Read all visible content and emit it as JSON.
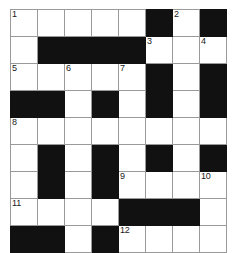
{
  "puzzle": {
    "type": "crossword-grid",
    "title": "",
    "columns": 8,
    "rows": 9,
    "cell_size_px": 26,
    "colors": {
      "block": "#111111",
      "empty": "#ffffff",
      "gridline": "#9a9a9a",
      "number_text": "#1a1a1a",
      "page_background": "#ffffff"
    },
    "clue_numbers": [
      1,
      2,
      3,
      4,
      5,
      6,
      7,
      8,
      9,
      10,
      11,
      12
    ],
    "legend": {
      "block_char": "#",
      "open_char": "."
    },
    "grid": [
      [
        {
          "state": "open",
          "number": "1"
        },
        {
          "state": "open",
          "number": ""
        },
        {
          "state": "open",
          "number": ""
        },
        {
          "state": "open",
          "number": ""
        },
        {
          "state": "open",
          "number": ""
        },
        {
          "state": "block",
          "number": ""
        },
        {
          "state": "open",
          "number": "2"
        },
        {
          "state": "block",
          "number": ""
        }
      ],
      [
        {
          "state": "open",
          "number": ""
        },
        {
          "state": "block",
          "number": ""
        },
        {
          "state": "block",
          "number": ""
        },
        {
          "state": "block",
          "number": ""
        },
        {
          "state": "block",
          "number": ""
        },
        {
          "state": "open",
          "number": "3"
        },
        {
          "state": "open",
          "number": ""
        },
        {
          "state": "open",
          "number": "4"
        }
      ],
      [
        {
          "state": "open",
          "number": "5"
        },
        {
          "state": "open",
          "number": ""
        },
        {
          "state": "open",
          "number": "6"
        },
        {
          "state": "open",
          "number": ""
        },
        {
          "state": "open",
          "number": "7"
        },
        {
          "state": "block",
          "number": ""
        },
        {
          "state": "open",
          "number": ""
        },
        {
          "state": "block",
          "number": ""
        }
      ],
      [
        {
          "state": "block",
          "number": ""
        },
        {
          "state": "block",
          "number": ""
        },
        {
          "state": "open",
          "number": ""
        },
        {
          "state": "block",
          "number": ""
        },
        {
          "state": "open",
          "number": ""
        },
        {
          "state": "block",
          "number": ""
        },
        {
          "state": "open",
          "number": ""
        },
        {
          "state": "block",
          "number": ""
        }
      ],
      [
        {
          "state": "open",
          "number": "8"
        },
        {
          "state": "open",
          "number": ""
        },
        {
          "state": "open",
          "number": ""
        },
        {
          "state": "open",
          "number": ""
        },
        {
          "state": "open",
          "number": ""
        },
        {
          "state": "open",
          "number": ""
        },
        {
          "state": "open",
          "number": ""
        },
        {
          "state": "open",
          "number": ""
        }
      ],
      [
        {
          "state": "open",
          "number": ""
        },
        {
          "state": "block",
          "number": ""
        },
        {
          "state": "open",
          "number": ""
        },
        {
          "state": "block",
          "number": ""
        },
        {
          "state": "open",
          "number": ""
        },
        {
          "state": "block",
          "number": ""
        },
        {
          "state": "open",
          "number": ""
        },
        {
          "state": "block",
          "number": ""
        }
      ],
      [
        {
          "state": "open",
          "number": ""
        },
        {
          "state": "block",
          "number": ""
        },
        {
          "state": "open",
          "number": ""
        },
        {
          "state": "block",
          "number": ""
        },
        {
          "state": "open",
          "number": "9"
        },
        {
          "state": "open",
          "number": ""
        },
        {
          "state": "open",
          "number": ""
        },
        {
          "state": "open",
          "number": "10"
        }
      ],
      [
        {
          "state": "open",
          "number": "11"
        },
        {
          "state": "open",
          "number": ""
        },
        {
          "state": "open",
          "number": ""
        },
        {
          "state": "open",
          "number": ""
        },
        {
          "state": "block",
          "number": ""
        },
        {
          "state": "block",
          "number": ""
        },
        {
          "state": "block",
          "number": ""
        },
        {
          "state": "open",
          "number": ""
        }
      ],
      [
        {
          "state": "block",
          "number": ""
        },
        {
          "state": "block",
          "number": ""
        },
        {
          "state": "open",
          "number": ""
        },
        {
          "state": "block",
          "number": ""
        },
        {
          "state": "open",
          "number": "12"
        },
        {
          "state": "open",
          "number": ""
        },
        {
          "state": "open",
          "number": ""
        },
        {
          "state": "open",
          "number": ""
        }
      ]
    ]
  }
}
